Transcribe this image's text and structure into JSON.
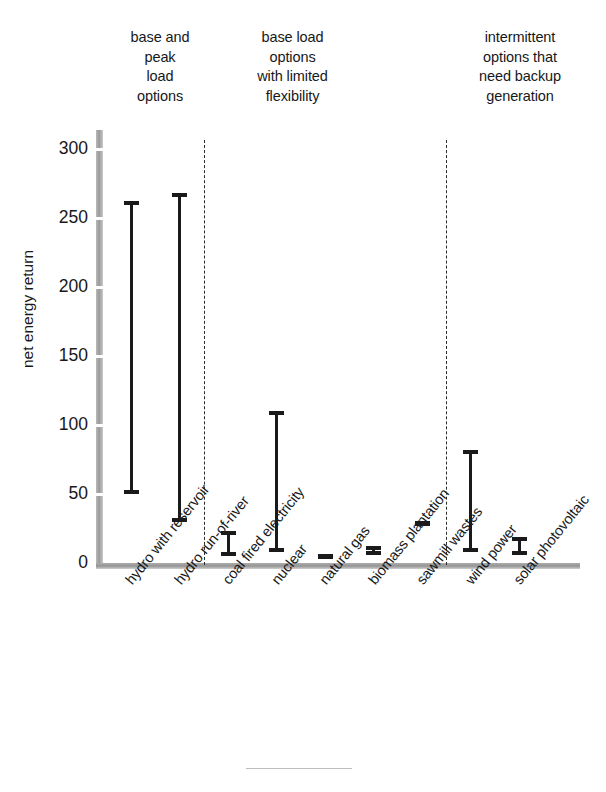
{
  "chart_data": {
    "type": "bar",
    "title": "",
    "subtitle": "",
    "xlabel": "",
    "ylabel": "net energy return",
    "ylim": [
      0,
      310
    ],
    "yticks": [
      0,
      50,
      100,
      150,
      200,
      250,
      300
    ],
    "grid": false,
    "legend": null,
    "value_kind": "range (low–high) per technology",
    "categories": [
      "hydro with reservoir",
      "hydro run-of-river",
      "coal fired electricity",
      "nuclear",
      "natural gas",
      "biomass plantation",
      "sawmill wastes",
      "wind power",
      "solar photovoltaic"
    ],
    "low": [
      50,
      30,
      5,
      8,
      5,
      6,
      29,
      8,
      6
    ],
    "high": [
      262,
      268,
      23,
      110,
      5,
      12,
      29,
      82,
      19
    ],
    "groups": [
      {
        "label": "base and\npeak\nload\noptions",
        "categories": [
          "hydro with reservoir",
          "hydro run-of-river"
        ]
      },
      {
        "label": "base load\noptions\nwith limited\nflexibility",
        "categories": [
          "coal fired electricity",
          "nuclear",
          "natural gas",
          "biomass plantation",
          "sawmill wastes"
        ]
      },
      {
        "label": "intermittent\noptions that\nneed backup\ngeneration",
        "categories": [
          "wind power",
          "solar photovoltaic"
        ]
      }
    ],
    "colors": {
      "bar": "#1a1a1a",
      "axis": "#9a9a9a",
      "text": "#16181a",
      "divider": "#2a2a2a",
      "background": "#ffffff"
    }
  },
  "axis": {
    "y_title": "net energy return",
    "y_tick_labels": [
      "300",
      "250",
      "200",
      "150",
      "100",
      "50",
      "0"
    ]
  },
  "groups": {
    "g0": "base and\npeak\nload\noptions",
    "g1": "base load\noptions\nwith limited\nflexibility",
    "g2": "intermittent\noptions that\nneed backup\ngeneration"
  },
  "categories": {
    "c0": "hydro with reservoir",
    "c1": "hydro run-of-river",
    "c2": "coal fired electricity",
    "c3": "nuclear",
    "c4": "natural gas",
    "c5": "biomass plantation",
    "c6": "sawmill wastes",
    "c7": "wind power",
    "c8": "solar photovoltaic"
  }
}
